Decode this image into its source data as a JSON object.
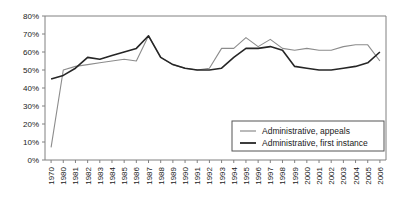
{
  "chart_data": {
    "type": "line",
    "title": "",
    "subtitle": "",
    "xlabel": "",
    "ylabel": "",
    "ylim": [
      0,
      80
    ],
    "ytick_labels": [
      "0%",
      "10%",
      "20%",
      "30%",
      "40%",
      "50%",
      "60%",
      "70%",
      "80%"
    ],
    "ytick_values": [
      0,
      10,
      20,
      30,
      40,
      50,
      60,
      70,
      80
    ],
    "grid": false,
    "legend_position": "bottom-right",
    "categories": [
      "1970",
      "1980",
      "1981",
      "1982",
      "1983",
      "1984",
      "1985",
      "1986",
      "1987",
      "1988",
      "1989",
      "1990",
      "1991",
      "1992",
      "1993",
      "1994",
      "1995",
      "1996",
      "1997",
      "1998",
      "1999",
      "2000",
      "2001",
      "2002",
      "2003",
      "2004",
      "2005",
      "2006"
    ],
    "series": [
      {
        "name": "Administrative, appeals",
        "color": "#8c8c8c",
        "values": [
          7,
          50,
          52,
          53,
          54,
          55,
          56,
          55,
          69,
          57,
          53,
          51,
          50,
          51,
          62,
          62,
          68,
          63,
          67,
          62,
          61,
          62,
          61,
          61,
          63,
          64,
          64,
          55
        ]
      },
      {
        "name": "Administrative, first instance",
        "color": "#262626",
        "values": [
          45,
          47,
          51,
          57,
          56,
          58,
          60,
          62,
          69,
          57,
          53,
          51,
          50,
          50,
          51,
          57,
          62,
          62,
          63,
          61,
          52,
          51,
          50,
          50,
          51,
          52,
          54,
          60
        ]
      }
    ]
  },
  "legend": {
    "items": [
      {
        "label": "Administrative, appeals",
        "swatch": "line-swatch-light"
      },
      {
        "label": "Administrative, first instance",
        "swatch": "line-swatch-dark"
      }
    ]
  }
}
